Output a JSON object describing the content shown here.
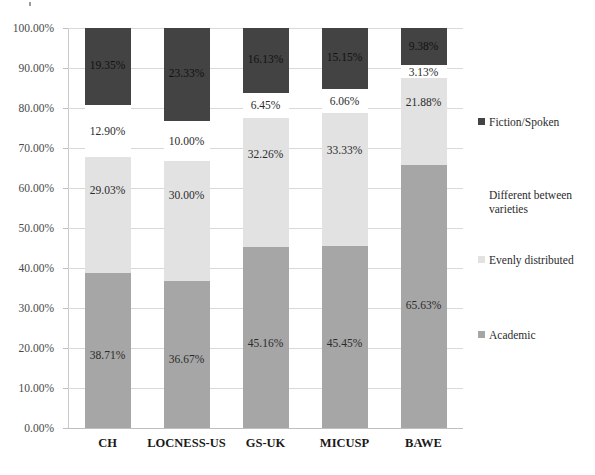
{
  "chart_data": {
    "type": "bar",
    "subtype": "stacked-100-percent",
    "title": "",
    "xlabel": "",
    "ylabel": "",
    "categories": [
      "CH",
      "LOCNESS-US",
      "GS-UK",
      "MICUSP",
      "BAWE"
    ],
    "series": [
      {
        "name": "Academic",
        "color": "#a6a6a6",
        "values": [
          38.71,
          36.67,
          45.16,
          45.45,
          65.63
        ],
        "labels": [
          "38.71%",
          "36.67%",
          "45.16%",
          "45.45%",
          "65.63%"
        ]
      },
      {
        "name": "Evenly distributed",
        "color": "#e2e2e2",
        "values": [
          29.03,
          30.0,
          32.26,
          33.33,
          21.88
        ],
        "labels": [
          "29.03%",
          "30.00%",
          "32.26%",
          "33.33%",
          "21.88%"
        ]
      },
      {
        "name": "Different between varieties",
        "color": "#ffffff",
        "values": [
          12.9,
          10.0,
          6.45,
          6.06,
          3.13
        ],
        "labels": [
          "12.90%",
          "10.00%",
          "6.45%",
          "6.06%",
          "3.13%"
        ]
      },
      {
        "name": "Fiction/Spoken",
        "color": "#434343",
        "values": [
          19.35,
          23.33,
          16.13,
          15.15,
          9.38
        ],
        "labels": [
          "19.35%",
          "23.33%",
          "16.13%",
          "15.15%",
          "9.38%"
        ]
      }
    ],
    "ylim": [
      0,
      100
    ],
    "ytick_labels": [
      "0.00%",
      "10.00%",
      "20.00%",
      "30.00%",
      "40.00%",
      "50.00%",
      "60.00%",
      "70.00%",
      "80.00%",
      "90.00%",
      "100.00%"
    ],
    "ytick_values": [
      0,
      10,
      20,
      30,
      40,
      50,
      60,
      70,
      80,
      90,
      100
    ],
    "grid": true,
    "legend_position": "right",
    "legend": [
      {
        "label": "Fiction/Spoken",
        "color": "#434343"
      },
      {
        "label": "Different between varieties",
        "color": "#ffffff"
      },
      {
        "label": "Evenly distributed",
        "color": "#e2e2e2"
      },
      {
        "label": "Academic",
        "color": "#a6a6a6"
      }
    ]
  }
}
